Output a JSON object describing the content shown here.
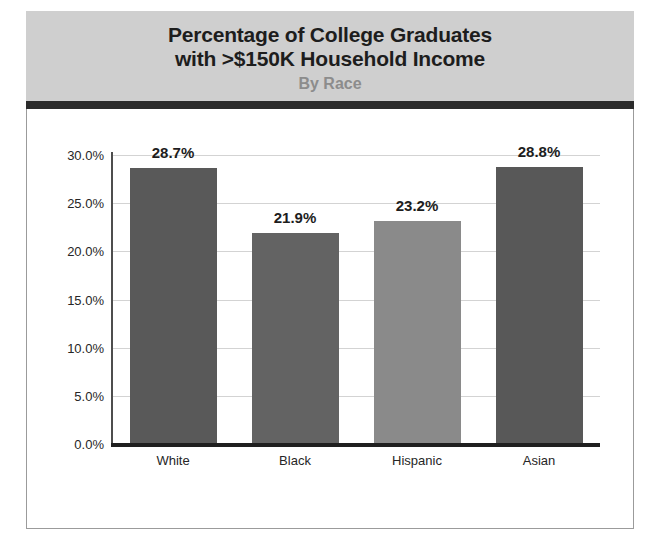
{
  "header": {
    "title_line1": "Percentage of College Graduates",
    "title_line2": "with >$150K Household Income",
    "subtitle": "By Race",
    "band_color": "#cfcfcf",
    "rule_color": "#2b2b2b",
    "title_color": "#1d1d1d",
    "subtitle_color": "#8c8c8c"
  },
  "chart_data": {
    "type": "bar",
    "title": "Percentage of College Graduates with >$150K Household Income",
    "subtitle": "By Race",
    "xlabel": "",
    "ylabel": "",
    "categories": [
      "White",
      "Black",
      "Hispanic",
      "Asian"
    ],
    "values": [
      28.7,
      21.9,
      23.2,
      28.8
    ],
    "data_labels": [
      "28.7%",
      "21.9%",
      "23.2%",
      "28.8%"
    ],
    "bar_colors": [
      "#595959",
      "#636363",
      "#8a8a8a",
      "#585858"
    ],
    "ylim": [
      0,
      30
    ],
    "ytick_values": [
      30.0,
      25.0,
      20.0,
      15.0,
      10.0,
      5.0,
      0.0
    ],
    "ytick_labels": [
      "30.0%",
      "25.0%",
      "20.0%",
      "15.0%",
      "10.0%",
      "5.0%",
      "0.0%"
    ],
    "grid": true,
    "grid_color": "#d3d3d3",
    "legend": "none",
    "legend_position": "none",
    "axis_color": "#1f1f1f",
    "frame_color": "#9b9b9b"
  }
}
